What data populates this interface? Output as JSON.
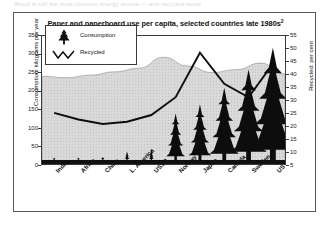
{
  "page": {
    "top_clipped_text": "Wood is still the most common energy source — and recycled wood"
  },
  "figure": {
    "title": "Paper and paperboard use per capita, selected countries late 1980s",
    "title_superscript": "2"
  },
  "legend": {
    "items": [
      {
        "label": "Consumption",
        "icon": "fir-tree-icon",
        "color": "#111111"
      },
      {
        "label": "Recycled",
        "icon": "zigzag-line-icon",
        "color": "#111111"
      }
    ]
  },
  "axes": {
    "left": {
      "title": "Consumption: kilograms per year",
      "ticks": [
        "0",
        "50",
        "100",
        "150",
        "200",
        "250",
        "300",
        "350"
      ],
      "min": 0,
      "max": 350
    },
    "right": {
      "title": "Recycled: per cent",
      "ticks": [
        "5",
        "10",
        "15",
        "20",
        "25",
        "30",
        "35",
        "40",
        "45",
        "50",
        "55"
      ],
      "min": 0,
      "max": 57.5
    }
  },
  "chart_data": {
    "type": "bar",
    "title": "Paper and paperboard use per capita, selected countries late 1980s",
    "xlabel": "",
    "ylabel": "Consumption: kilograms per year",
    "y2label": "Recycled: per cent",
    "ylim": [
      0,
      350
    ],
    "y2lim": [
      0,
      57.5
    ],
    "grid": false,
    "legend_position": "upper-left",
    "categories": [
      "India",
      "Africa",
      "China",
      "L. America",
      "USSR",
      "Norway",
      "Japan",
      "Canada",
      "Sweden",
      "US"
    ],
    "series": [
      {
        "name": "Consumption",
        "unit": "kilograms per year",
        "axis": "left",
        "render": "fir-tree",
        "values": [
          4,
          6,
          10,
          26,
          34,
          130,
          155,
          200,
          250,
          310
        ]
      },
      {
        "name": "Recycled",
        "unit": "per cent",
        "axis": "right",
        "render": "line",
        "values": [
          23,
          20,
          18,
          19,
          22,
          30,
          50,
          36,
          30,
          45
        ]
      }
    ]
  },
  "xlabels": [
    {
      "label": "India"
    },
    {
      "label": "Africa"
    },
    {
      "label": "China"
    },
    {
      "label": "L. America"
    },
    {
      "label": "USSR"
    },
    {
      "label": "Norway"
    },
    {
      "label": "Japan"
    },
    {
      "label": "Canada"
    },
    {
      "label": "Sweden"
    },
    {
      "label": "US"
    }
  ]
}
